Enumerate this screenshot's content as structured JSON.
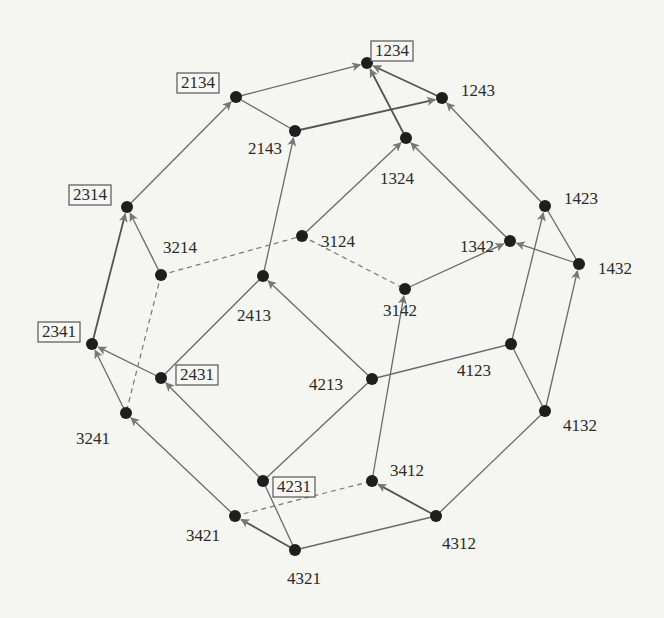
{
  "diagram": {
    "type": "permutohedron-graph",
    "nodes": [
      {
        "id": "1234",
        "x": 367,
        "y": 63,
        "boxed": true,
        "lx": 375,
        "ly": 52,
        "anchor": "start"
      },
      {
        "id": "2134",
        "x": 236,
        "y": 97,
        "boxed": true,
        "lx": 181,
        "ly": 84,
        "anchor": "start"
      },
      {
        "id": "1243",
        "x": 442,
        "y": 98,
        "boxed": false,
        "lx": 461,
        "ly": 92,
        "anchor": "start"
      },
      {
        "id": "2143",
        "x": 295,
        "y": 131,
        "boxed": false,
        "lx": 248,
        "ly": 150,
        "anchor": "start"
      },
      {
        "id": "1324",
        "x": 406,
        "y": 138,
        "boxed": false,
        "lx": 380,
        "ly": 180,
        "anchor": "start"
      },
      {
        "id": "2314",
        "x": 127,
        "y": 207,
        "boxed": true,
        "lx": 73,
        "ly": 196,
        "anchor": "start"
      },
      {
        "id": "1423",
        "x": 545,
        "y": 206,
        "boxed": false,
        "lx": 564,
        "ly": 200,
        "anchor": "start"
      },
      {
        "id": "3124",
        "x": 302,
        "y": 236,
        "boxed": false,
        "lx": 321,
        "ly": 243,
        "anchor": "start"
      },
      {
        "id": "3214",
        "x": 161,
        "y": 275,
        "boxed": false,
        "lx": 163,
        "ly": 249,
        "anchor": "start"
      },
      {
        "id": "1342",
        "x": 510,
        "y": 241,
        "boxed": false,
        "lx": 460,
        "ly": 248,
        "anchor": "start"
      },
      {
        "id": "1432",
        "x": 579,
        "y": 264,
        "boxed": false,
        "lx": 598,
        "ly": 270,
        "anchor": "start"
      },
      {
        "id": "2413",
        "x": 263,
        "y": 276,
        "boxed": false,
        "lx": 237,
        "ly": 317,
        "anchor": "start"
      },
      {
        "id": "2341",
        "x": 92,
        "y": 344,
        "boxed": true,
        "lx": 42,
        "ly": 333,
        "anchor": "start"
      },
      {
        "id": "3142",
        "x": 405,
        "y": 289,
        "boxed": false,
        "lx": 383,
        "ly": 312,
        "anchor": "start"
      },
      {
        "id": "4123",
        "x": 511,
        "y": 344,
        "boxed": false,
        "lx": 457,
        "ly": 372,
        "anchor": "start"
      },
      {
        "id": "2431",
        "x": 161,
        "y": 378,
        "boxed": true,
        "lx": 180,
        "ly": 376,
        "anchor": "start"
      },
      {
        "id": "4213",
        "x": 372,
        "y": 379,
        "boxed": false,
        "lx": 309,
        "ly": 386,
        "anchor": "start"
      },
      {
        "id": "3241",
        "x": 126,
        "y": 413,
        "boxed": false,
        "lx": 76,
        "ly": 440,
        "anchor": "start"
      },
      {
        "id": "4132",
        "x": 545,
        "y": 411,
        "boxed": false,
        "lx": 563,
        "ly": 427,
        "anchor": "start"
      },
      {
        "id": "4231",
        "x": 263,
        "y": 481,
        "boxed": true,
        "lx": 277,
        "ly": 488,
        "anchor": "start"
      },
      {
        "id": "3412",
        "x": 372,
        "y": 481,
        "boxed": false,
        "lx": 390,
        "ly": 472,
        "anchor": "start"
      },
      {
        "id": "3421",
        "x": 235,
        "y": 516,
        "boxed": false,
        "lx": 186,
        "ly": 537,
        "anchor": "start"
      },
      {
        "id": "4312",
        "x": 436,
        "y": 516,
        "boxed": false,
        "lx": 442,
        "ly": 545,
        "anchor": "start"
      },
      {
        "id": "4321",
        "x": 295,
        "y": 550,
        "boxed": false,
        "lx": 287,
        "ly": 580,
        "anchor": "start"
      }
    ],
    "edges": [
      {
        "from": "2134",
        "to": "1234",
        "style": "solid",
        "arrow": true
      },
      {
        "from": "1243",
        "to": "1234",
        "style": "thick",
        "arrow": true
      },
      {
        "from": "1324",
        "to": "1234",
        "style": "thick",
        "arrow": true
      },
      {
        "from": "2143",
        "to": "1243",
        "style": "thick",
        "arrow": true
      },
      {
        "from": "2134",
        "to": "2143",
        "style": "solid",
        "arrow": false
      },
      {
        "from": "2314",
        "to": "2134",
        "style": "solid",
        "arrow": true
      },
      {
        "from": "2413",
        "to": "2143",
        "style": "solid",
        "arrow": true
      },
      {
        "from": "3124",
        "to": "1324",
        "style": "solid",
        "arrow": true
      },
      {
        "from": "1342",
        "to": "1324",
        "style": "solid",
        "arrow": true
      },
      {
        "from": "1423",
        "to": "1243",
        "style": "solid",
        "arrow": true
      },
      {
        "from": "1432",
        "to": "1342",
        "style": "solid",
        "arrow": true
      },
      {
        "from": "1423",
        "to": "1432",
        "style": "solid",
        "arrow": false
      },
      {
        "from": "4123",
        "to": "1423",
        "style": "solid",
        "arrow": true
      },
      {
        "from": "4132",
        "to": "1432",
        "style": "solid",
        "arrow": true
      },
      {
        "from": "3142",
        "to": "1342",
        "style": "solid",
        "arrow": true
      },
      {
        "from": "4123",
        "to": "4132",
        "style": "solid",
        "arrow": false
      },
      {
        "from": "4213",
        "to": "4123",
        "style": "solid",
        "arrow": false
      },
      {
        "from": "3412",
        "to": "3142",
        "style": "solid",
        "arrow": true
      },
      {
        "from": "4213",
        "to": "2413",
        "style": "solid",
        "arrow": true
      },
      {
        "from": "4231",
        "to": "4213",
        "style": "solid",
        "arrow": false
      },
      {
        "from": "2431",
        "to": "2413",
        "style": "solid",
        "arrow": false
      },
      {
        "from": "3214",
        "to": "2314",
        "style": "solid",
        "arrow": true
      },
      {
        "from": "2341",
        "to": "2314",
        "style": "thick",
        "arrow": true
      },
      {
        "from": "2431",
        "to": "2341",
        "style": "solid",
        "arrow": true
      },
      {
        "from": "3241",
        "to": "2341",
        "style": "solid",
        "arrow": true
      },
      {
        "from": "4231",
        "to": "2431",
        "style": "solid",
        "arrow": true
      },
      {
        "from": "3421",
        "to": "3241",
        "style": "solid",
        "arrow": true
      },
      {
        "from": "4321",
        "to": "3421",
        "style": "thick",
        "arrow": true
      },
      {
        "from": "4321",
        "to": "4231",
        "style": "solid",
        "arrow": false
      },
      {
        "from": "4321",
        "to": "4312",
        "style": "solid",
        "arrow": false
      },
      {
        "from": "4312",
        "to": "3412",
        "style": "thick",
        "arrow": true
      },
      {
        "from": "4312",
        "to": "4132",
        "style": "solid",
        "arrow": false
      },
      {
        "from": "3214",
        "to": "3124",
        "style": "dashed",
        "arrow": false
      },
      {
        "from": "3124",
        "to": "3142",
        "style": "dashed",
        "arrow": false
      },
      {
        "from": "3214",
        "to": "3241",
        "style": "dashed",
        "arrow": false
      },
      {
        "from": "3421",
        "to": "3412",
        "style": "dashed",
        "arrow": false
      }
    ]
  }
}
